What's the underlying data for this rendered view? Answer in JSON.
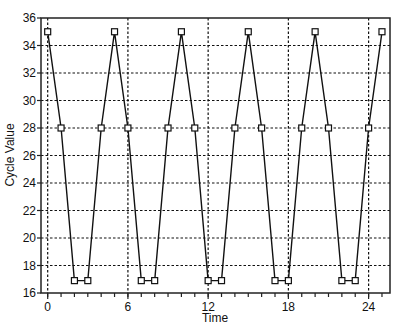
{
  "chart_data": {
    "type": "line",
    "title": "",
    "xlabel": "Time",
    "ylabel": "Cycle Value",
    "xlim": [
      -0.5,
      25.6
    ],
    "ylim": [
      16,
      36
    ],
    "xticks": [
      0,
      6,
      12,
      18,
      24
    ],
    "xticks_minor_step": 1,
    "yticks": [
      16,
      18,
      20,
      22,
      24,
      26,
      28,
      30,
      32,
      34,
      36
    ],
    "grid": true,
    "grid_style": "dotted",
    "legend": null,
    "marker": "square",
    "series": [
      {
        "name": "Cycle Value",
        "x": [
          0,
          1,
          2,
          3,
          4,
          5,
          6,
          7,
          8,
          9,
          10,
          11,
          12,
          13,
          14,
          15,
          16,
          17,
          18,
          19,
          20,
          21,
          22,
          23,
          24,
          25
        ],
        "values": [
          35,
          28,
          16.9,
          16.9,
          28,
          35,
          28,
          16.9,
          16.9,
          28,
          35,
          28,
          16.9,
          16.9,
          28,
          35,
          28,
          16.9,
          16.9,
          28,
          35,
          28,
          16.9,
          16.9,
          28,
          35
        ]
      }
    ]
  },
  "colors": {
    "line": "#111111",
    "grid": "#111111",
    "background": "#ffffff"
  }
}
